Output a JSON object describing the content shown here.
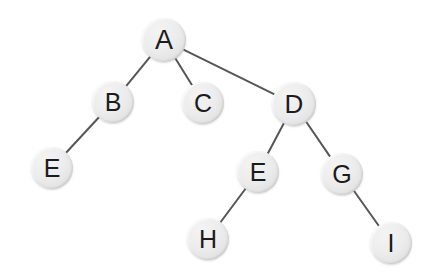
{
  "diagram": {
    "kind": "tree-diagram",
    "background_color": "#ffffff",
    "node_fill_color": "#ebebeb",
    "node_stroke_color": "#d6d6d6",
    "edge_color": "#565656",
    "label_color": "#1c1c1c",
    "edge_width": 2,
    "width": 437,
    "height": 280,
    "nodes": [
      {
        "id": "A",
        "label": "A",
        "x": 164,
        "y": 40,
        "r": 22,
        "font_size": 27
      },
      {
        "id": "B",
        "label": "B",
        "x": 113,
        "y": 102,
        "r": 21,
        "font_size": 25
      },
      {
        "id": "C",
        "label": "C",
        "x": 203,
        "y": 103,
        "r": 21,
        "font_size": 25
      },
      {
        "id": "D",
        "label": "D",
        "x": 294,
        "y": 104,
        "r": 22,
        "font_size": 26
      },
      {
        "id": "E1",
        "label": "E",
        "x": 52,
        "y": 168,
        "r": 21,
        "font_size": 25
      },
      {
        "id": "E2",
        "label": "E",
        "x": 258,
        "y": 172,
        "r": 21,
        "font_size": 25
      },
      {
        "id": "G",
        "label": "G",
        "x": 342,
        "y": 174,
        "r": 21,
        "font_size": 25
      },
      {
        "id": "H",
        "label": "H",
        "x": 208,
        "y": 239,
        "r": 21,
        "font_size": 25
      },
      {
        "id": "I",
        "label": "I",
        "x": 391,
        "y": 243,
        "r": 21,
        "font_size": 25
      }
    ],
    "edges": [
      {
        "from": "A",
        "to": "B"
      },
      {
        "from": "A",
        "to": "C"
      },
      {
        "from": "A",
        "to": "D"
      },
      {
        "from": "B",
        "to": "E1"
      },
      {
        "from": "D",
        "to": "E2"
      },
      {
        "from": "D",
        "to": "G"
      },
      {
        "from": "E2",
        "to": "H"
      },
      {
        "from": "G",
        "to": "I"
      }
    ]
  }
}
